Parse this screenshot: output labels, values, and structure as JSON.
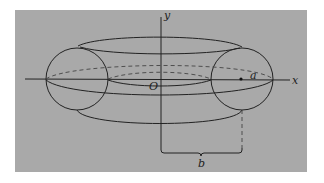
{
  "figure": {
    "background_color": "#a9a9a9",
    "line_color": "#222222",
    "labels": {
      "x_axis": "x",
      "y_axis": "y",
      "origin": "O",
      "tube_radius": "a",
      "center_distance": "b"
    }
  }
}
